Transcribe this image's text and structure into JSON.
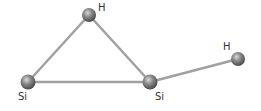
{
  "diagram": {
    "title": "",
    "atoms": [
      {
        "id": "H1",
        "label": "H",
        "x": 89,
        "y": 15,
        "label_x": 98,
        "label_y": 3
      },
      {
        "id": "Si1",
        "label": "Si",
        "x": 28,
        "y": 82,
        "label_x": 18,
        "label_y": 92
      },
      {
        "id": "Si2",
        "label": "Si",
        "x": 150,
        "y": 82,
        "label_x": 155,
        "label_y": 92
      },
      {
        "id": "H2",
        "label": "H",
        "x": 238,
        "y": 59,
        "label_x": 223,
        "label_y": 42
      }
    ],
    "bonds": [
      {
        "from": "H1",
        "to": "Si1"
      },
      {
        "from": "H1",
        "to": "Si2"
      },
      {
        "from": "Si1",
        "to": "Si2"
      },
      {
        "from": "Si2",
        "to": "H2"
      }
    ],
    "colors": {
      "bond": "#9a9a9a",
      "atom": "#6f6f6f",
      "label": "#333333"
    }
  }
}
